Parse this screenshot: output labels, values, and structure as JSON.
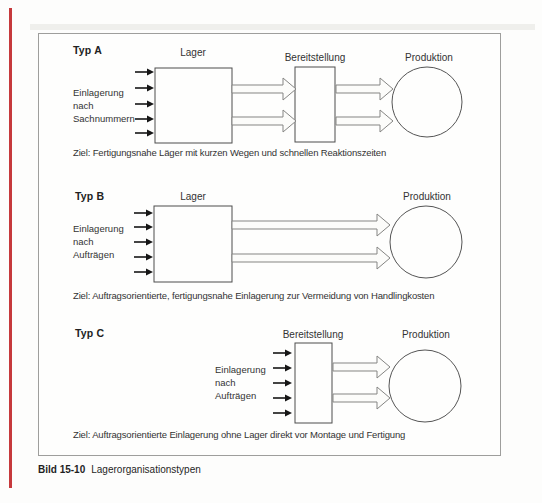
{
  "figure": {
    "caption": {
      "number": "Bild 15-10",
      "title": "Lagerorganisationstypen"
    },
    "accent_color": "#c6393c",
    "sections": [
      {
        "typ": "Typ A",
        "input_lines": [
          "Einlagerung",
          "nach",
          "Sachnummern"
        ],
        "labels": {
          "lager": "Lager",
          "bereitstellung": "Bereitstellung",
          "produktion": "Produktion"
        },
        "ziel": "Ziel: Fertigungsnahe Läger mit kurzen Wegen und schnellen Reaktionszeiten"
      },
      {
        "typ": "Typ B",
        "input_lines": [
          "Einlagerung",
          "nach",
          "Aufträgen"
        ],
        "labels": {
          "lager": "Lager",
          "produktion": "Produktion"
        },
        "ziel": "Ziel: Auftragsorientierte, fertigungsnahe Einlagerung zur Vermeidung von Handlingkosten"
      },
      {
        "typ": "Typ C",
        "input_lines": [
          "Einlagerung",
          "nach",
          "Aufträgen"
        ],
        "labels": {
          "bereitstellung": "Bereitstellung",
          "produktion": "Produktion"
        },
        "ziel": "Ziel: Auftragsorientierte Einlagerung ohne Lager direkt vor Montage und Fertigung"
      }
    ]
  }
}
